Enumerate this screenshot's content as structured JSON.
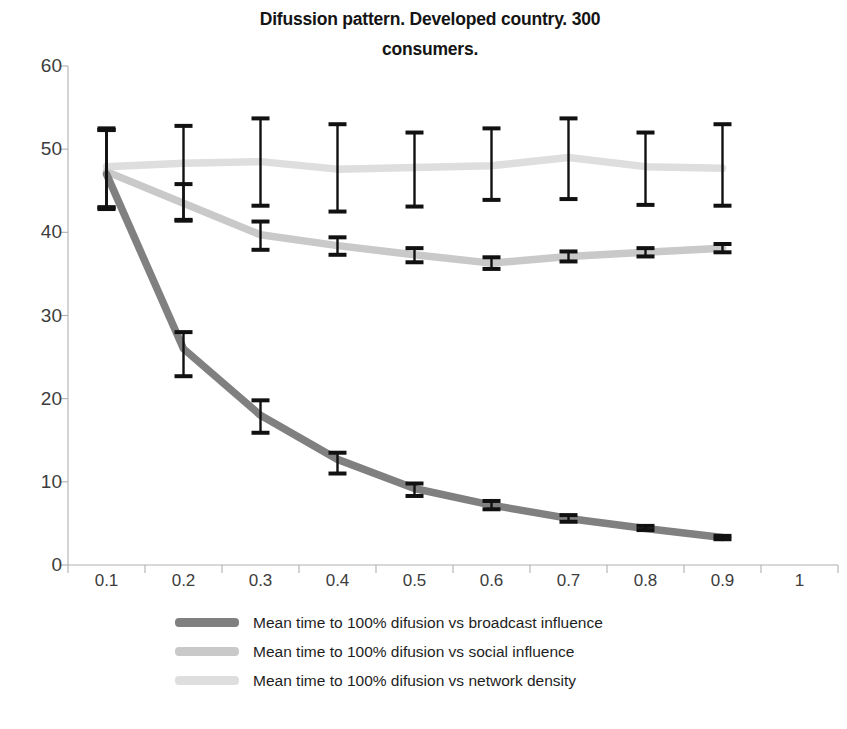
{
  "chart_data": {
    "type": "line",
    "title": "Difussion pattern. Developed country. 300 consumers.",
    "title_line1": "Difussion pattern. Developed country. 300",
    "title_line2": "consumers.",
    "xlabel": "",
    "ylabel": "",
    "x": [
      0.1,
      0.2,
      0.3,
      0.4,
      0.5,
      0.6,
      0.7,
      0.8,
      0.9
    ],
    "x_categories": [
      "0.1",
      "0.2",
      "0.3",
      "0.4",
      "0.5",
      "0.6",
      "0.7",
      "0.8",
      "0.9",
      "1"
    ],
    "xlim": [
      0.05,
      1.05
    ],
    "ylim": [
      0,
      60
    ],
    "yticks": [
      0,
      10,
      20,
      30,
      40,
      50,
      60
    ],
    "ytick_labels": [
      "0",
      "10",
      "20",
      "30",
      "40",
      "50",
      "60"
    ],
    "grid": false,
    "legend_position": "bottom",
    "error_bars": true,
    "series": [
      {
        "name": "Mean time to 100% difusion vs broadcast influence",
        "color": "#808080",
        "values": [
          47.0,
          26.0,
          18.0,
          12.7,
          9.2,
          7.2,
          5.6,
          4.4,
          3.3
        ],
        "err_low": [
          43.0,
          22.7,
          15.9,
          11.0,
          8.3,
          6.7,
          5.2,
          4.2,
          3.1
        ],
        "err_high": [
          52.3,
          28.0,
          19.8,
          13.5,
          9.8,
          7.7,
          6.0,
          4.7,
          3.5
        ]
      },
      {
        "name": "Mean time to 100% difusion vs social influence",
        "color": "#c9c9c9",
        "values": [
          47.3,
          43.5,
          39.7,
          38.4,
          37.3,
          36.3,
          37.1,
          37.6,
          38.1
        ],
        "err_low": [
          43.0,
          41.4,
          37.9,
          37.3,
          36.4,
          35.6,
          36.5,
          37.1,
          37.6
        ],
        "err_high": [
          52.3,
          45.8,
          41.3,
          39.4,
          38.1,
          37.0,
          37.7,
          38.1,
          38.6
        ]
      },
      {
        "name": "Mean time to 100% difusion vs network density",
        "color": "#dedede",
        "values": [
          47.9,
          48.3,
          48.5,
          47.6,
          47.8,
          48.0,
          49.0,
          47.9,
          47.7
        ],
        "err_low": [
          42.8,
          41.5,
          43.2,
          42.5,
          43.1,
          43.9,
          44.0,
          43.3,
          43.2
        ],
        "err_high": [
          52.5,
          52.8,
          53.7,
          53.0,
          52.0,
          52.5,
          53.7,
          52.0,
          53.0
        ]
      }
    ],
    "axis_color": "#b0b0b0",
    "errorbar_color": "#111111",
    "background": "#ffffff"
  }
}
